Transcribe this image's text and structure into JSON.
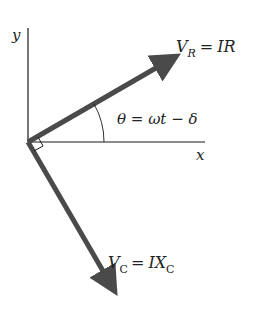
{
  "diagram": {
    "axes": {
      "y_label": "y",
      "x_label": "x"
    },
    "phasors": [
      {
        "name": "V_R",
        "symbol": "V",
        "subscript": "R",
        "equals": "=",
        "rhs": "IR"
      },
      {
        "name": "V_C",
        "symbol": "V",
        "subscript": "C",
        "equals": "=",
        "rhs_main": "IX",
        "rhs_sub": "C"
      }
    ],
    "angle": {
      "label": "θ = ωt − δ"
    },
    "right_angle_marker": true,
    "colors": {
      "axis": "#1a1a1a",
      "phasor": "#4a4a4a",
      "text": "#222222"
    }
  }
}
